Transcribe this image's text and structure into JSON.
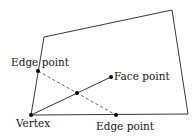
{
  "diagram": {
    "polygon": {
      "points": "44,37 172,10 188,114 31,115",
      "stroke": "#3a3a3a"
    },
    "lines": {
      "vertex_to_face": {
        "x1": 31,
        "y1": 115,
        "x2": 111,
        "y2": 77,
        "style": "solid"
      },
      "edge_to_edge": {
        "x1": 38,
        "y1": 71,
        "x2": 116,
        "y2": 115,
        "style": "dashed"
      }
    },
    "points": {
      "vertex": {
        "cx": 31,
        "cy": 115
      },
      "edge_left": {
        "cx": 38,
        "cy": 71
      },
      "edge_bottom": {
        "cx": 116,
        "cy": 115
      },
      "face": {
        "cx": 111,
        "cy": 77
      },
      "midpoint": {
        "cx": 77,
        "cy": 93
      }
    },
    "labels": {
      "edge_left": "Edge point",
      "face": "Face point",
      "vertex": "Vertex",
      "edge_bottom": "Edge point"
    },
    "colors": {
      "stroke": "#333333",
      "dot": "#000000",
      "dashed": "#555555"
    }
  }
}
